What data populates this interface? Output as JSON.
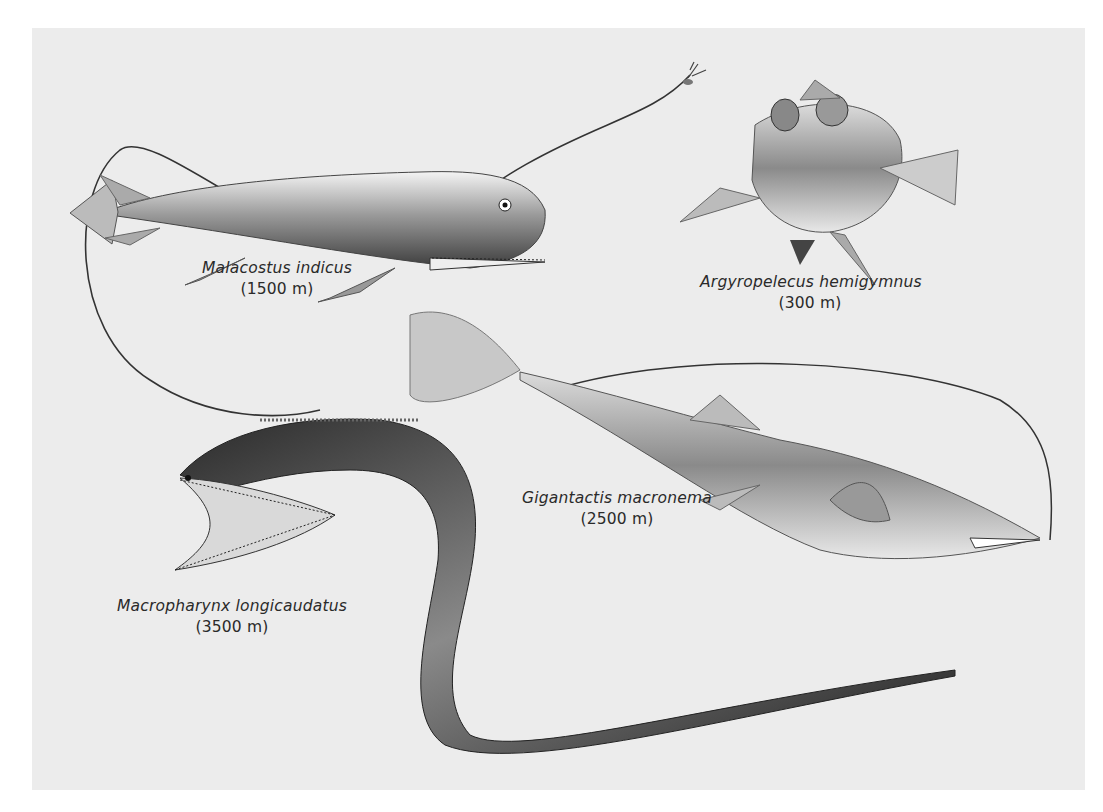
{
  "figure": {
    "background_color": "#ececec",
    "species": [
      {
        "id": "malacostus",
        "name": "Malacostus indicus",
        "depth": "(1500 m)"
      },
      {
        "id": "argyropelecus",
        "name": "Argyropelecus hemigymnus",
        "depth": "(300 m)"
      },
      {
        "id": "gigantactis",
        "name": "Gigantactis macronema",
        "depth": "(2500 m)"
      },
      {
        "id": "macropharynx",
        "name": "Macropharynx longicaudatus",
        "depth": "(3500 m)"
      }
    ]
  }
}
